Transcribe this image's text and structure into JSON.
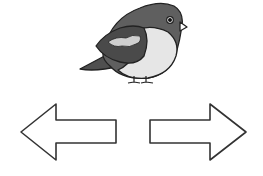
{
  "image": {
    "subject": "bird",
    "label": "Cartoon bird"
  },
  "navigation": {
    "previous_label": "Previous",
    "next_label": "Next"
  },
  "colors": {
    "body_dark": "#5f5f5f",
    "body_light": "#e6e6e6",
    "wing_dark": "#4a4a4a",
    "wing_light": "#cfcfcf",
    "tail": "#4f4f4f",
    "outline": "#222222",
    "arrow_fill": "#ffffff",
    "arrow_stroke": "#333333"
  }
}
